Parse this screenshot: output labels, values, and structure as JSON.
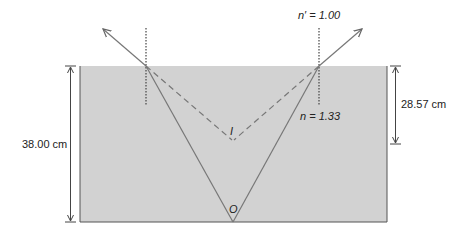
{
  "diagram": {
    "medium_top": {
      "label": "n′ = 1.00"
    },
    "medium_water": {
      "label": "n = 1.33",
      "fill": "#d2d2d2"
    },
    "points": {
      "object": {
        "label": "O"
      },
      "image": {
        "label": "I"
      }
    },
    "dimensions": {
      "actual_depth": {
        "label": "38.00 cm"
      },
      "apparent_depth": {
        "label": "28.57 cm"
      }
    },
    "colors": {
      "water": "#d2d2d2",
      "ray": "#777777",
      "outline": "#555555",
      "text": "#222222"
    }
  }
}
